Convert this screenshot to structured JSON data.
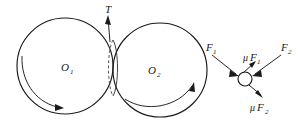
{
  "figure": {
    "background_color": "#ffffff",
    "ink_color": "#1a1a1a"
  },
  "labels": {
    "disc_left": {
      "base": "O",
      "sub": "1"
    },
    "disc_right": {
      "base": "O",
      "sub": "2"
    },
    "tension": {
      "base": "T",
      "sub": ""
    },
    "force_left": {
      "base": "F",
      "sub": "1"
    },
    "force_right": {
      "base": "F",
      "sub": "2"
    },
    "friction_left": {
      "mu": "μ",
      "base": "F",
      "sub": "1"
    },
    "friction_right": {
      "mu": "μ",
      "base": "F",
      "sub": "2"
    }
  },
  "geometry": {
    "left_disc": {
      "cx": 65,
      "cy": 66,
      "r": 48
    },
    "right_disc": {
      "cx": 160,
      "cy": 70,
      "r": 47
    },
    "contact_lens": {
      "cx": 113,
      "cy": 68,
      "rx": 6,
      "ry": 28
    },
    "particle": {
      "cx": 245,
      "cy": 79,
      "r": 7
    }
  },
  "annotations": {
    "left_disc_rotation": "clockwise-arc-arrow",
    "right_disc_rotation": "counterclockwise-arc-arrow",
    "tension_direction": "up",
    "force_left_direction": "down-right",
    "force_right_direction": "down-left",
    "friction_left_direction": "up-right",
    "friction_right_direction": "down-right"
  }
}
